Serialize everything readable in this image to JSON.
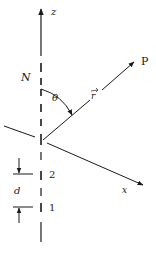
{
  "diagram": {
    "colors": {
      "ink": "#1a1a1a",
      "background": "#ffffff"
    },
    "labels": {
      "z_axis": "z",
      "x_axis": "x",
      "element_top": "N",
      "angle": "θ",
      "position_vector": "r",
      "point": "P",
      "element_2": "2",
      "element_1": "1",
      "spacing": "d"
    }
  }
}
